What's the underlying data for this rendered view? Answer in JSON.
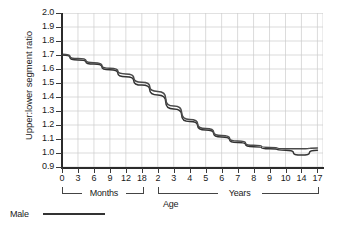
{
  "chart_data": {
    "type": "line",
    "title": "",
    "subtitle": "",
    "ylabel": "Upper:lower segment ratio",
    "xlabel": "Age",
    "ylim": [
      0.9,
      2.0
    ],
    "y_ticks": [
      "2.0",
      "1.9",
      "1.8",
      "1.7",
      "1.6",
      "1.5",
      "1.4",
      "1.3",
      "1.2",
      "1.1",
      "1.0",
      "0.9"
    ],
    "y_tick_values": [
      2.0,
      1.9,
      1.8,
      1.7,
      1.6,
      1.5,
      1.4,
      1.3,
      1.2,
      1.1,
      1.0,
      0.9
    ],
    "grid": true,
    "grid_color": "#cccccc",
    "legend": {
      "position": "below-left",
      "entries": [
        {
          "name": "Male",
          "color": "#333333",
          "style": "solid"
        }
      ]
    },
    "x_tick_labels": [
      "0",
      "3",
      "6",
      "9",
      "12",
      "18",
      "2",
      "3",
      "4",
      "5",
      "6",
      "7",
      "8",
      "9",
      "10",
      "14",
      "17"
    ],
    "x_groups": [
      {
        "label": "Months",
        "from_index": 0,
        "to_index": 5
      },
      {
        "label": "Years",
        "from_index": 6,
        "to_index": 16
      }
    ],
    "categories": [
      "0",
      "3",
      "6",
      "9",
      "12",
      "18",
      "2",
      "3",
      "4",
      "5",
      "6",
      "7",
      "8",
      "9",
      "10",
      "14",
      "17"
    ],
    "series": [
      {
        "name": "Male",
        "color": "#333333",
        "values": [
          1.7,
          1.665,
          1.635,
          1.595,
          1.545,
          1.485,
          1.415,
          1.315,
          1.225,
          1.165,
          1.115,
          1.075,
          1.045,
          1.03,
          1.02,
          0.985,
          1.02
        ]
      },
      {
        "name": "Male upper trace",
        "color": "#4a4a4a",
        "values": [
          1.705,
          1.675,
          1.645,
          1.605,
          1.565,
          1.505,
          1.44,
          1.335,
          1.24,
          1.175,
          1.125,
          1.085,
          1.055,
          1.04,
          1.03,
          1.03,
          1.035
        ]
      }
    ]
  },
  "axis": {
    "y_title": "Upper:lower segment ratio",
    "x_title": "Age",
    "months_bracket": "Months",
    "years_bracket": "Years"
  },
  "legend": {
    "male_label": "Male"
  }
}
